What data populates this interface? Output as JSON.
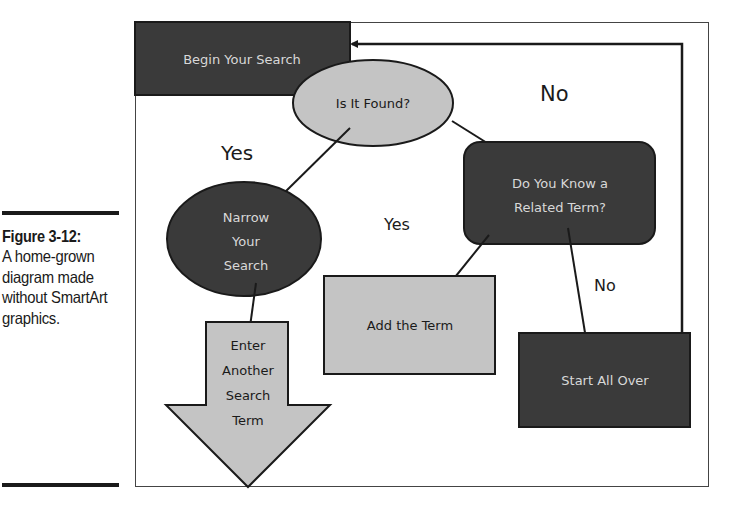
{
  "caption": {
    "label": "Figure 3-12:",
    "text": "A home-grown diagram made without SmartArt graphics."
  },
  "diagram": {
    "nodes": {
      "begin": {
        "label": "Begin Your Search",
        "shape": "rectangle",
        "fill": "#3a3a3a",
        "text_color": "#d8d8d8"
      },
      "found": {
        "label": "Is It Found?",
        "shape": "ellipse",
        "fill": "#c4c4c4",
        "text_color": "#1a1a1a"
      },
      "related": {
        "line1": "Do You Know a",
        "line2": "Related Term?",
        "shape": "rounded-rectangle",
        "fill": "#3a3a3a",
        "text_color": "#d8d8d8"
      },
      "narrow": {
        "line1": "Narrow",
        "line2": "Your",
        "line3": "Search",
        "shape": "ellipse",
        "fill": "#3a3a3a",
        "text_color": "#d8d8d8"
      },
      "add": {
        "label": "Add the Term",
        "shape": "rectangle",
        "fill": "#c4c4c4",
        "text_color": "#1a1a1a"
      },
      "start_over": {
        "label": "Start All Over",
        "shape": "rectangle",
        "fill": "#3a3a3a",
        "text_color": "#d8d8d8"
      },
      "enter": {
        "line1": "Enter",
        "line2": "Another",
        "line3": "Search",
        "line4": "Term",
        "shape": "down-arrow",
        "fill": "#c4c4c4",
        "text_color": "#1a1a1a"
      }
    },
    "edge_labels": {
      "found_no": "No",
      "found_yes": "Yes",
      "related_yes": "Yes",
      "related_no": "No"
    },
    "edges": [
      {
        "from": "begin",
        "to": "found"
      },
      {
        "from": "found",
        "to": "narrow",
        "label": "Yes"
      },
      {
        "from": "found",
        "to": "related",
        "label": "No"
      },
      {
        "from": "related",
        "to": "add",
        "label": "Yes"
      },
      {
        "from": "related",
        "to": "start_over",
        "label": "No"
      },
      {
        "from": "narrow",
        "to": "enter"
      },
      {
        "from": "start_over",
        "to": "begin"
      }
    ]
  }
}
